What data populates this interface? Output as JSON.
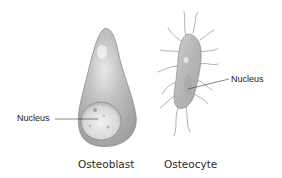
{
  "figure": {
    "cells": [
      {
        "id": "osteoblast",
        "caption": "Osteoblast",
        "nucleus_label": "Nucleus"
      },
      {
        "id": "osteocyte",
        "caption": "Osteocyte",
        "nucleus_label": "Nucleus"
      }
    ],
    "colors": {
      "cell_body": "#b9b9b9",
      "cell_outline": "#8c8c8c",
      "nucleus": "#e6e6e6",
      "leader_line": "#333333",
      "text": "#1a1a1a"
    }
  }
}
